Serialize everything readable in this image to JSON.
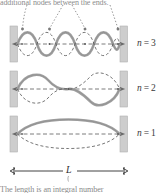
{
  "figure": {
    "title_text_top": "additional nodes between the ends.",
    "caption_bottom": "The length is an integral number",
    "dimension_label": "L",
    "modes": [
      {
        "id": "n3",
        "label_n": "n",
        "label_eq": "=",
        "label_value": "3",
        "harmonic": 3
      },
      {
        "id": "n2",
        "label_n": "n",
        "label_eq": "=",
        "label_value": "2",
        "harmonic": 2
      },
      {
        "id": "n1",
        "label_n": "n",
        "label_eq": "=",
        "label_value": "1",
        "harmonic": 1
      }
    ],
    "annotation_arrows_count": 4,
    "colors": {
      "wave_solid": "#9e9e9e",
      "wave_dashed": "#4a4a4a",
      "wall_fill": "#c9c9c9",
      "wall_edge": "#8f8f8f",
      "axis_dash": "#5a5a5a",
      "arrow": "#7a7a7a",
      "text": "#3a3a3a",
      "caption": "#8a8a8a",
      "background": "#ffffff"
    }
  }
}
